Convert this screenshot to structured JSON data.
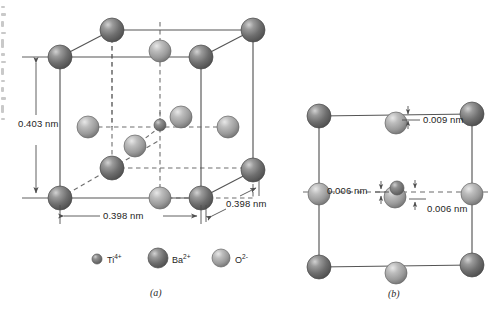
{
  "figure": {
    "background_color": "#ffffff",
    "line_color": "#555555",
    "text_color": "#1d1d1d"
  },
  "panel_a": {
    "letter": "(a)",
    "dimensions": [
      {
        "id": "height",
        "value": "0.403 nm",
        "orientation": "vertical"
      },
      {
        "id": "width-front",
        "value": "0.398 nm",
        "orientation": "horizontal"
      },
      {
        "id": "depth-diagonal",
        "value": "0.398 nm",
        "orientation": "diagonal"
      }
    ]
  },
  "panel_b": {
    "letter": "(b)",
    "dimensions": [
      {
        "id": "oxygen-top-displacement",
        "value": "0.009 nm"
      },
      {
        "id": "oxygen-side-displacement",
        "value": "0.006 nm"
      },
      {
        "id": "titanium-displacement",
        "value": "0.006 nm"
      }
    ]
  },
  "legend": {
    "items": [
      {
        "id": "ti",
        "symbol": "Ti",
        "charge": "4+",
        "sphere": "small-dark-sphere",
        "color": "#6e6e6e",
        "radius": 5
      },
      {
        "id": "ba",
        "symbol": "Ba",
        "charge": "2+",
        "sphere": "large-dark-sphere",
        "color": "#6b6b6b",
        "radius": 10
      },
      {
        "id": "o",
        "symbol": "O",
        "charge": "2-",
        "sphere": "medium-light-sphere",
        "color": "#9d9d9d",
        "radius": 9
      }
    ]
  },
  "colors": {
    "ba_fill": "#6f6f6f",
    "ba_highlight": "#c9c9c9",
    "o_fill": "#9c9c9c",
    "o_highlight": "#e0e0e0",
    "ti_fill": "#6a6a6a",
    "solid_edge": "#5a5a5a",
    "dashed_edge": "#6a6a6a"
  }
}
